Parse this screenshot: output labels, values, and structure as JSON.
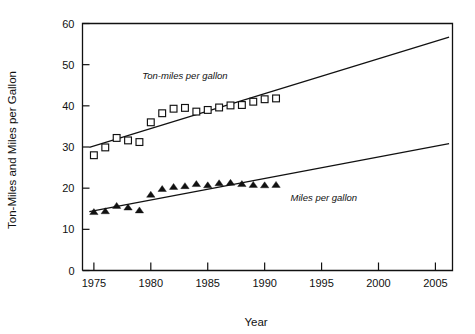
{
  "chart_data": {
    "type": "scatter",
    "title": "",
    "xlabel": "Year",
    "ylabel": "Ton-Miles and Miles per Gallon",
    "xlim": [
      1974,
      2006.5
    ],
    "ylim": [
      0,
      60
    ],
    "grid": false,
    "legend_position": "inline-annotation",
    "x_ticks": [
      1975,
      1980,
      1985,
      1990,
      1995,
      2000,
      2005
    ],
    "x_tick_labels": [
      "1975",
      "1980",
      "1985",
      "1990",
      "1995",
      "2000",
      "2005"
    ],
    "y_ticks": [
      0,
      10,
      20,
      30,
      40,
      50,
      60
    ],
    "y_tick_labels": [
      "0",
      "10",
      "20",
      "30",
      "40",
      "50",
      "60"
    ],
    "annotations": [
      {
        "text": "Ton-miles per gallon",
        "x": 1983.0,
        "y": 46.5
      },
      {
        "text": "Miles per gallon",
        "x": 1995.2,
        "y": 16.8
      }
    ],
    "series": [
      {
        "name": "Ton-miles per gallon",
        "marker": "open-square",
        "x": [
          1975,
          1976,
          1977,
          1978,
          1979,
          1980,
          1981,
          1982,
          1983,
          1984,
          1985,
          1986,
          1987,
          1988,
          1989,
          1990,
          1991
        ],
        "values": [
          28.0,
          29.9,
          32.2,
          31.6,
          31.2,
          36.0,
          38.2,
          39.3,
          39.5,
          38.6,
          39.0,
          39.6,
          40.1,
          40.2,
          41.0,
          41.6,
          41.8
        ]
      },
      {
        "name": "Miles per gallon",
        "marker": "filled-triangle",
        "x": [
          1975,
          1976,
          1977,
          1978,
          1979,
          1980,
          1981,
          1982,
          1983,
          1984,
          1985,
          1986,
          1987,
          1988,
          1989,
          1990,
          1991
        ],
        "values": [
          14.2,
          14.4,
          15.7,
          15.3,
          14.6,
          18.4,
          19.8,
          20.3,
          20.5,
          21.0,
          20.7,
          21.2,
          21.3,
          21.0,
          20.8,
          20.7,
          20.8
        ]
      }
    ],
    "trend_lines": [
      {
        "name": "Ton-miles per gallon trend",
        "x_start": 1974.6,
        "y_start": 29.9,
        "x_end": 2006.2,
        "y_end": 56.7
      },
      {
        "name": "Miles per gallon trend",
        "x_start": 1974.6,
        "y_start": 14.3,
        "x_end": 2006.2,
        "y_end": 30.8
      }
    ]
  }
}
